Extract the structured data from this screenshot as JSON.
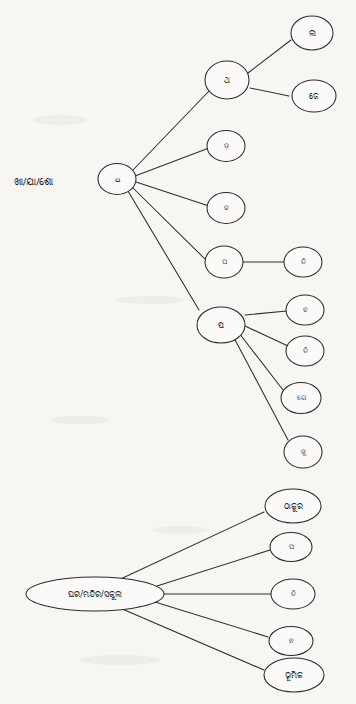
{
  "page": {
    "background_color": "#f7f6f3",
    "ink_color": "#2b2b2d",
    "node_fill": "#fbfaf8",
    "width": 356,
    "height": 704
  },
  "diagram": {
    "type": "node-link-tree"
  },
  "tree_upper": {
    "caption": "ଖା/ଯା/ଶୋ",
    "hub": "ଧ",
    "branches": [
      {
        "label": "ଥ",
        "children": [
          "ଲ",
          "ଜେ"
        ]
      },
      {
        "label": "ଡ଼",
        "children": []
      },
      {
        "label": "ଢ",
        "children": []
      },
      {
        "label": "ଘ",
        "children": [
          "ତି"
        ]
      },
      {
        "label": "ପ",
        "children": [
          "ବ",
          "ତି",
          "ଗେ",
          "ଜୁ"
        ]
      }
    ]
  },
  "tree_lower": {
    "hub": "ଘର/ମନ୍ଦିର/ସ୍କୁଲ",
    "children": [
      "ଠାକୁର",
      "ଘ",
      "ତି",
      "ନ",
      "ଭୂମିକ"
    ]
  },
  "labels": {
    "root_caption": "ଖା/ଯା/ଶୋ",
    "hub_upper": "ଧ",
    "n_tha": "ଥ",
    "n_la": "ଲ",
    "n_je": "ଜେ",
    "n_dda": "ଡ଼",
    "n_ddha": "ଢ",
    "n_gha": "ଘ",
    "n_ti_a": "ତି",
    "n_pa": "ପ",
    "n_ba": "ବ",
    "n_ti_b": "ତି",
    "n_ge": "ଗେ",
    "n_ju": "ଜୁ",
    "hub_lower": "ଘର/ମନ୍ଦିର/ସ୍କୁଲ",
    "n_thakura": "ଠାକୁର",
    "n_gha2": "ଘ",
    "n_ti_c": "ତି",
    "n_na": "ନ",
    "n_bhumika": "ଭୂମିକ"
  }
}
